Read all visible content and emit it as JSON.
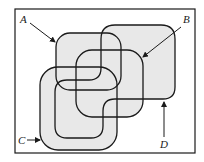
{
  "diagram": {
    "type": "venn-like overlapping regions",
    "frame": {
      "x": 15,
      "y": 9,
      "width": 180,
      "height": 144
    },
    "fill_color": "#e8e8e8",
    "stroke_color": "#1a1a1a",
    "labels": [
      {
        "id": "A",
        "text": "A",
        "x": 20,
        "y": 23,
        "arrow_from": [
          30,
          23
        ],
        "arrow_to": [
          56,
          43
        ]
      },
      {
        "id": "B",
        "text": "B",
        "x": 183,
        "y": 23,
        "arrow_from": [
          181,
          27
        ],
        "arrow_to": [
          142,
          58
        ]
      },
      {
        "id": "C",
        "text": "C",
        "x": 18,
        "y": 144,
        "arrow_from": [
          27,
          140
        ],
        "arrow_to": [
          40,
          140
        ]
      },
      {
        "id": "D",
        "text": "D",
        "x": 160,
        "y": 148,
        "arrow_from": [
          164,
          137
        ],
        "arrow_to": [
          164,
          102
        ]
      }
    ],
    "regions": [
      {
        "id": "A",
        "shape": "rounded-square",
        "bounds": [
          56,
          33,
          121,
          90
        ]
      },
      {
        "id": "B",
        "shape": "rounded-square",
        "bounds": [
          76,
          50,
          143,
          117
        ]
      },
      {
        "id": "C",
        "shape": "rounded-square",
        "bounds": [
          40,
          67,
          117,
          150
        ]
      },
      {
        "id": "D",
        "shape": "z-shaped rounded region",
        "bounds": [
          55,
          25,
          175,
          138
        ]
      }
    ]
  }
}
